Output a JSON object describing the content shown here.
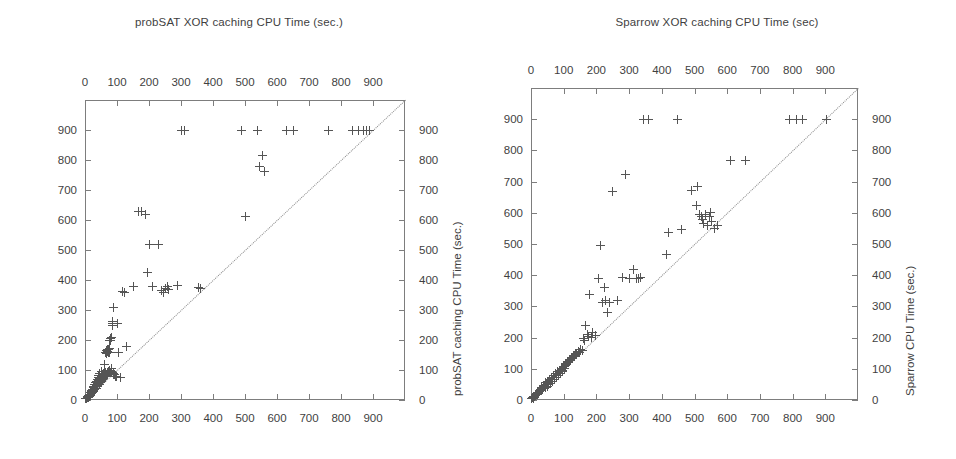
{
  "figure": {
    "width": 956,
    "height": 459,
    "marker_color": "#555555",
    "axis_color": "#7d7d7d",
    "text_color": "#3f3f3f",
    "diagonal_style": "dotted"
  },
  "panels": [
    {
      "id": "left",
      "title": "probSAT XOR caching CPU Time (sec.)",
      "x_axis_title_top": "probSAT XOR caching CPU Time (sec.)",
      "y_axis_title_right": "probSAT caching CPU Time (sec.)",
      "x_ticks": [
        0,
        100,
        200,
        300,
        400,
        500,
        600,
        700,
        800,
        900
      ],
      "y_ticks": [
        0,
        100,
        200,
        300,
        400,
        500,
        600,
        700,
        800,
        900
      ],
      "xlim": [
        0,
        1000
      ],
      "ylim": [
        0,
        1000
      ]
    },
    {
      "id": "right",
      "title": "Sparrow XOR caching CPU Time (sec)",
      "x_axis_title_top": "Sparrow XOR caching CPU Time (sec)",
      "y_axis_title_right": "Sparrow CPU Time (sec.)",
      "x_ticks": [
        0,
        100,
        200,
        300,
        400,
        500,
        600,
        700,
        800,
        900
      ],
      "y_ticks": [
        0,
        100,
        200,
        300,
        400,
        500,
        600,
        700,
        800,
        900
      ],
      "xlim": [
        0,
        1000
      ],
      "ylim": [
        0,
        1000
      ]
    }
  ],
  "chart_data": [
    {
      "type": "scatter",
      "title": "probSAT XOR caching CPU Time (sec.)",
      "xlabel": "probSAT XOR caching CPU Time (sec.)",
      "ylabel": "probSAT caching CPU Time (sec.)",
      "xlim": [
        0,
        1000
      ],
      "ylim": [
        0,
        1000
      ],
      "xticks": [
        0,
        100,
        200,
        300,
        400,
        500,
        600,
        700,
        800,
        900
      ],
      "yticks": [
        0,
        100,
        200,
        300,
        400,
        500,
        600,
        700,
        800,
        900
      ],
      "grid": false,
      "legend": "none",
      "marker": "plus",
      "reference_line": {
        "type": "diagonal",
        "equation": "y = x",
        "style": "dotted"
      },
      "points": [
        [
          3,
          4
        ],
        [
          5,
          6
        ],
        [
          6,
          5
        ],
        [
          7,
          9
        ],
        [
          8,
          7
        ],
        [
          9,
          12
        ],
        [
          10,
          9
        ],
        [
          11,
          14
        ],
        [
          12,
          11
        ],
        [
          13,
          17
        ],
        [
          14,
          13
        ],
        [
          15,
          20
        ],
        [
          16,
          16
        ],
        [
          17,
          24
        ],
        [
          18,
          19
        ],
        [
          19,
          28
        ],
        [
          20,
          22
        ],
        [
          21,
          33
        ],
        [
          22,
          25
        ],
        [
          23,
          30
        ],
        [
          24,
          36
        ],
        [
          25,
          28
        ],
        [
          26,
          41
        ],
        [
          27,
          33
        ],
        [
          28,
          46
        ],
        [
          29,
          37
        ],
        [
          30,
          34
        ],
        [
          31,
          52
        ],
        [
          32,
          40
        ],
        [
          33,
          58
        ],
        [
          34,
          44
        ],
        [
          35,
          38
        ],
        [
          36,
          63
        ],
        [
          37,
          48
        ],
        [
          38,
          70
        ],
        [
          39,
          52
        ],
        [
          40,
          45
        ],
        [
          41,
          75
        ],
        [
          42,
          57
        ],
        [
          43,
          82
        ],
        [
          44,
          61
        ],
        [
          45,
          52
        ],
        [
          46,
          88
        ],
        [
          47,
          66
        ],
        [
          48,
          72
        ],
        [
          49,
          57
        ],
        [
          50,
          95
        ],
        [
          51,
          70
        ],
        [
          52,
          78
        ],
        [
          53,
          62
        ],
        [
          54,
          84
        ],
        [
          55,
          74
        ],
        [
          56,
          68
        ],
        [
          57,
          90
        ],
        [
          58,
          80
        ],
        [
          59,
          72
        ],
        [
          60,
          96
        ],
        [
          61,
          86
        ],
        [
          62,
          118
        ],
        [
          63,
          77
        ],
        [
          64,
          92
        ],
        [
          65,
          160
        ],
        [
          66,
          82
        ],
        [
          67,
          155
        ],
        [
          68,
          165
        ],
        [
          69,
          170
        ],
        [
          70,
          88
        ],
        [
          71,
          162
        ],
        [
          72,
          158
        ],
        [
          73,
          95
        ],
        [
          74,
          168
        ],
        [
          75,
          172
        ],
        [
          76,
          100
        ],
        [
          77,
          160
        ],
        [
          78,
          200
        ],
        [
          79,
          205
        ],
        [
          80,
          92
        ],
        [
          81,
          198
        ],
        [
          82,
          210
        ],
        [
          83,
          104
        ],
        [
          84,
          96
        ],
        [
          85,
          255
        ],
        [
          86,
          262
        ],
        [
          87,
          250
        ],
        [
          88,
          88
        ],
        [
          89,
          310
        ],
        [
          90,
          86
        ],
        [
          92,
          84
        ],
        [
          95,
          80
        ],
        [
          98,
          78
        ],
        [
          100,
          256
        ],
        [
          104,
          160
        ],
        [
          110,
          76
        ],
        [
          118,
          362
        ],
        [
          122,
          360
        ],
        [
          130,
          180
        ],
        [
          150,
          380
        ],
        [
          168,
          628
        ],
        [
          178,
          628
        ],
        [
          188,
          618
        ],
        [
          196,
          426
        ],
        [
          200,
          518
        ],
        [
          210,
          380
        ],
        [
          230,
          518
        ],
        [
          238,
          365
        ],
        [
          245,
          358
        ],
        [
          252,
          372
        ],
        [
          258,
          380
        ],
        [
          262,
          368
        ],
        [
          288,
          382
        ],
        [
          300,
          900
        ],
        [
          310,
          900
        ],
        [
          355,
          375
        ],
        [
          360,
          372
        ],
        [
          490,
          900
        ],
        [
          500,
          612
        ],
        [
          540,
          900
        ],
        [
          545,
          778
        ],
        [
          555,
          815
        ],
        [
          560,
          762
        ],
        [
          630,
          900
        ],
        [
          650,
          900
        ],
        [
          760,
          900
        ],
        [
          835,
          900
        ],
        [
          855,
          900
        ],
        [
          870,
          900
        ],
        [
          880,
          898
        ],
        [
          888,
          900
        ]
      ]
    },
    {
      "type": "scatter",
      "title": "Sparrow XOR caching CPU Time (sec)",
      "xlabel": "Sparrow XOR caching CPU Time (sec)",
      "ylabel": "Sparrow CPU Time (sec.)",
      "xlim": [
        0,
        1000
      ],
      "ylim": [
        0,
        1000
      ],
      "xticks": [
        0,
        100,
        200,
        300,
        400,
        500,
        600,
        700,
        800,
        900
      ],
      "yticks": [
        0,
        100,
        200,
        300,
        400,
        500,
        600,
        700,
        800,
        900
      ],
      "grid": false,
      "legend": "none",
      "marker": "plus",
      "reference_line": {
        "type": "diagonal",
        "equation": "y = x",
        "style": "dotted"
      },
      "points": [
        [
          3,
          4
        ],
        [
          5,
          7
        ],
        [
          7,
          6
        ],
        [
          9,
          11
        ],
        [
          11,
          10
        ],
        [
          13,
          16
        ],
        [
          15,
          14
        ],
        [
          17,
          20
        ],
        [
          19,
          18
        ],
        [
          21,
          25
        ],
        [
          23,
          22
        ],
        [
          25,
          30
        ],
        [
          27,
          26
        ],
        [
          29,
          35
        ],
        [
          31,
          32
        ],
        [
          33,
          40
        ],
        [
          35,
          36
        ],
        [
          37,
          45
        ],
        [
          39,
          42
        ],
        [
          41,
          48
        ],
        [
          43,
          40
        ],
        [
          45,
          55
        ],
        [
          47,
          50
        ],
        [
          49,
          44
        ],
        [
          51,
          60
        ],
        [
          53,
          56
        ],
        [
          55,
          50
        ],
        [
          57,
          66
        ],
        [
          59,
          60
        ],
        [
          61,
          54
        ],
        [
          63,
          72
        ],
        [
          65,
          66
        ],
        [
          67,
          60
        ],
        [
          69,
          78
        ],
        [
          71,
          72
        ],
        [
          73,
          66
        ],
        [
          75,
          84
        ],
        [
          77,
          78
        ],
        [
          79,
          72
        ],
        [
          81,
          90
        ],
        [
          83,
          84
        ],
        [
          85,
          78
        ],
        [
          87,
          96
        ],
        [
          89,
          90
        ],
        [
          91,
          84
        ],
        [
          93,
          102
        ],
        [
          95,
          96
        ],
        [
          97,
          90
        ],
        [
          99,
          108
        ],
        [
          101,
          102
        ],
        [
          104,
          112
        ],
        [
          107,
          118
        ],
        [
          110,
          114
        ],
        [
          113,
          124
        ],
        [
          116,
          120
        ],
        [
          119,
          130
        ],
        [
          122,
          126
        ],
        [
          125,
          136
        ],
        [
          128,
          132
        ],
        [
          131,
          144
        ],
        [
          134,
          140
        ],
        [
          137,
          150
        ],
        [
          140,
          146
        ],
        [
          144,
          156
        ],
        [
          148,
          152
        ],
        [
          152,
          162
        ],
        [
          156,
          158
        ],
        [
          160,
          196
        ],
        [
          164,
          192
        ],
        [
          168,
          240
        ],
        [
          172,
          210
        ],
        [
          176,
          205
        ],
        [
          180,
          338
        ],
        [
          184,
          200
        ],
        [
          188,
          215
        ],
        [
          196,
          208
        ],
        [
          205,
          388
        ],
        [
          212,
          496
        ],
        [
          218,
          312
        ],
        [
          224,
          360
        ],
        [
          228,
          318
        ],
        [
          234,
          282
        ],
        [
          240,
          312
        ],
        [
          248,
          668
        ],
        [
          265,
          320
        ],
        [
          280,
          392
        ],
        [
          290,
          722
        ],
        [
          300,
          390
        ],
        [
          312,
          418
        ],
        [
          322,
          388
        ],
        [
          330,
          390
        ],
        [
          336,
          392
        ],
        [
          345,
          900
        ],
        [
          360,
          900
        ],
        [
          415,
          466
        ],
        [
          420,
          538
        ],
        [
          448,
          900
        ],
        [
          460,
          548
        ],
        [
          492,
          672
        ],
        [
          505,
          622
        ],
        [
          510,
          684
        ],
        [
          515,
          594
        ],
        [
          520,
          588
        ],
        [
          525,
          580
        ],
        [
          528,
          566
        ],
        [
          534,
          596
        ],
        [
          540,
          560
        ],
        [
          545,
          588
        ],
        [
          548,
          602
        ],
        [
          552,
          572
        ],
        [
          560,
          550
        ],
        [
          570,
          560
        ],
        [
          610,
          768
        ],
        [
          655,
          768
        ],
        [
          790,
          900
        ],
        [
          812,
          900
        ],
        [
          830,
          900
        ],
        [
          905,
          900
        ]
      ]
    }
  ]
}
